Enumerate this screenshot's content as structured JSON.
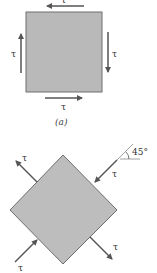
{
  "figure_a": {
    "caption": "(a)",
    "shear_labels": {
      "top": "τ",
      "left": "τ",
      "right": "τ",
      "bottom": "τ"
    },
    "fill_color": "#b9b9b9",
    "edge_color": "#6e6e6e"
  },
  "figure_b": {
    "angle_label": "45°",
    "stress_labels": {
      "top_left": "τ",
      "top_right": "τ",
      "bottom_left": "τ",
      "bottom_right": "τ"
    },
    "fill_color": "#bdbdbd",
    "edge_color": "#6e6e6e",
    "arrow_color": "#555555"
  }
}
